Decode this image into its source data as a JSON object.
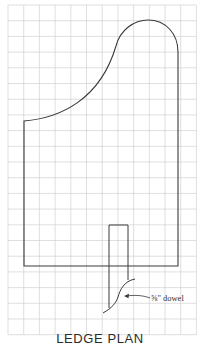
{
  "figure": {
    "title": "LEDGE PLAN",
    "subtitle": "",
    "callouts": [
      {
        "label": "⅝\" dowel",
        "target": "dowel"
      }
    ]
  },
  "grid": {
    "x_start": 8,
    "y_start": 5,
    "spacing": 15.7,
    "columns": 12,
    "rows": 21,
    "line_color": "#c9c9c9"
  },
  "colors": {
    "outline": "#3a3a3a",
    "background": "#ffffff",
    "text": "#2b2b2b"
  }
}
